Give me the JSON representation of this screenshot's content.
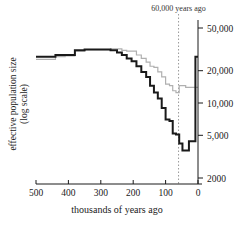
{
  "figure": {
    "annotation": {
      "label": "60,000 years ago",
      "x_value": 60,
      "line_style": "dotted",
      "line_color": "#9a9a9a"
    },
    "background": "#ffffff"
  },
  "chart_data": {
    "type": "line",
    "subtype": "step",
    "title": "",
    "xlabel": "thousands of years ago",
    "ylabel": "effective population size\n(log scale)",
    "ylabel_line1": "effective population size",
    "ylabel_line2": "(log scale)",
    "xlim": [
      500,
      0
    ],
    "x_reversed": true,
    "ylim": [
      2000,
      60000
    ],
    "yscale": "log",
    "grid": false,
    "legend": "none",
    "xticks": [
      500,
      400,
      300,
      200,
      100,
      0
    ],
    "xticklabels": [
      "500",
      "400",
      "300",
      "200",
      "100",
      "0"
    ],
    "yticks": [
      50000,
      20000,
      10000,
      5000,
      2000
    ],
    "yticklabels": [
      "50,000",
      "20,000",
      "10,000",
      "5,000",
      "2000"
    ],
    "yaxis_position": "right",
    "series": [
      {
        "name": "population-curve-dark",
        "color": "#1a1a1a",
        "width": 2.0,
        "x": [
          500,
          470,
          440,
          410,
          380,
          350,
          320,
          290,
          270,
          250,
          235,
          220,
          205,
          190,
          175,
          160,
          148,
          136,
          124,
          112,
          100,
          88,
          78,
          68,
          58,
          48,
          38,
          28,
          18,
          8,
          0
        ],
        "y": [
          27000,
          27000,
          28000,
          28000,
          31000,
          31500,
          31500,
          31500,
          31000,
          29500,
          28000,
          26000,
          24500,
          22000,
          19500,
          17500,
          14500,
          12500,
          11000,
          9000,
          7000,
          6800,
          5200,
          5100,
          4200,
          3600,
          3600,
          4400,
          4400,
          27000,
          27000
        ]
      },
      {
        "name": "population-curve-light",
        "color": "#b0b0b0",
        "width": 1.2,
        "x": [
          500,
          470,
          440,
          410,
          380,
          350,
          320,
          290,
          270,
          250,
          235,
          220,
          205,
          190,
          175,
          160,
          148,
          136,
          124,
          112,
          100,
          88,
          78,
          68,
          58,
          48,
          38,
          28,
          18,
          8,
          0
        ],
        "y": [
          25500,
          25500,
          27000,
          27500,
          30500,
          31500,
          31500,
          31500,
          32000,
          32000,
          31000,
          30500,
          30500,
          28000,
          26000,
          24000,
          22000,
          21500,
          19500,
          17500,
          15000,
          14500,
          13000,
          12500,
          14500,
          14500,
          14000,
          14000,
          14000,
          14000,
          14000
        ]
      }
    ]
  }
}
